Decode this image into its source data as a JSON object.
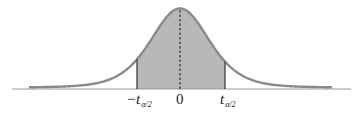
{
  "figure": {
    "type": "t-distribution density with shaded central region",
    "colors": {
      "background": "#ffffff",
      "curve_stroke": "#8a8a8a",
      "shaded_fill": "#b8b8b8",
      "axis": "#9a9a9a",
      "bounds": "#333333",
      "center_line": "#333333"
    },
    "labels": {
      "left_bound": {
        "main": "−t",
        "sub": "α/2"
      },
      "center": {
        "main": "0"
      },
      "right_bound": {
        "main": "t",
        "sub": "α/2"
      }
    },
    "geometry": {
      "baseline_y": 89,
      "axis_x_start": 12,
      "axis_x_end": 351,
      "tail_x_start": 29,
      "tail_x_end": 332,
      "peak_x": 180,
      "peak_y": 10,
      "shade_left_x": 137,
      "shade_right_x": 225
    }
  }
}
